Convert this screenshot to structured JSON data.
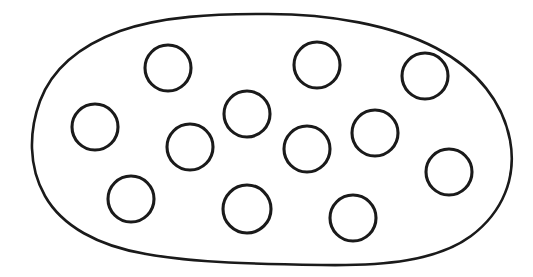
{
  "canvas": {
    "width": 533,
    "height": 277,
    "background_color": "#ffffff"
  },
  "diagram": {
    "type": "venn-set-diagram",
    "stroke_color": "#1a1a1a",
    "fill_color": "#ffffff",
    "blob": {
      "name": "outer-set-boundary",
      "stroke_width": 2.6,
      "path": "M 268 14 C 330 14 392 25 436 48 C 478 70 503 103 510 140 C 517 177 503 212 471 236 C 437 261 384 266 322 265 C 258 264 196 263 146 254 C 98 246 62 226 45 196 C 28 166 29 131 40 101 C 52 69 79 46 120 31 C 163 16 213 14 268 14 Z",
      "bounds": {
        "left": 34,
        "top": 13,
        "right": 512,
        "bottom": 266
      }
    },
    "circle_count": 12,
    "circle_stroke_width": 3.1,
    "circles": [
      {
        "id": "circle-1",
        "label": "top-left-inner",
        "cx": 168,
        "cy": 68,
        "r": 23
      },
      {
        "id": "circle-2",
        "label": "top-center-right",
        "cx": 317,
        "cy": 65,
        "r": 23
      },
      {
        "id": "circle-3",
        "label": "top-right",
        "cx": 425,
        "cy": 76,
        "r": 23
      },
      {
        "id": "circle-4",
        "label": "left-middle",
        "cx": 95,
        "cy": 127,
        "r": 23
      },
      {
        "id": "circle-5",
        "label": "center-upper",
        "cx": 247,
        "cy": 114,
        "r": 23
      },
      {
        "id": "circle-6",
        "label": "right-middle-upper",
        "cx": 375,
        "cy": 133,
        "r": 23
      },
      {
        "id": "circle-7",
        "label": "left-center",
        "cx": 190,
        "cy": 147,
        "r": 23
      },
      {
        "id": "circle-8",
        "label": "center-lower",
        "cx": 307,
        "cy": 149,
        "r": 23
      },
      {
        "id": "circle-9",
        "label": "far-right-lower",
        "cx": 449,
        "cy": 172,
        "r": 23
      },
      {
        "id": "circle-10",
        "label": "bottom-left",
        "cx": 131,
        "cy": 199,
        "r": 23
      },
      {
        "id": "circle-11",
        "label": "bottom-center",
        "cx": 247,
        "cy": 209,
        "r": 24
      },
      {
        "id": "circle-12",
        "label": "bottom-right",
        "cx": 353,
        "cy": 218,
        "r": 23
      }
    ]
  }
}
